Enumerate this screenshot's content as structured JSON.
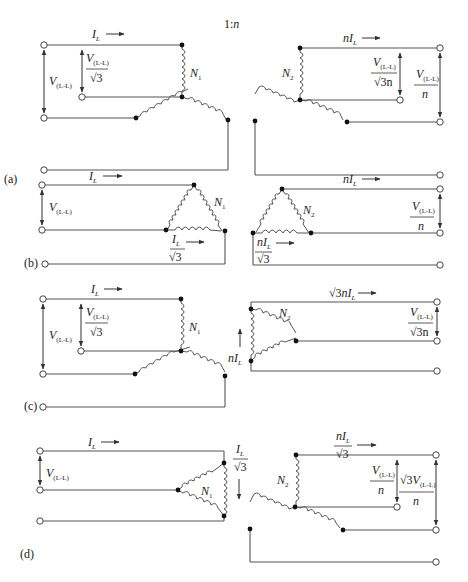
{
  "figure": {
    "ratio_label": "1:n",
    "panels": [
      {
        "id": "a",
        "tag": "(a)",
        "primary": {
          "connection": "wye",
          "current_label": "I_L",
          "line_voltage": "V(L-L)",
          "phase_voltage": "V(L-L)/√3",
          "winding": "N1"
        },
        "secondary": {
          "connection": "wye",
          "current_label": "nI_L",
          "phase_voltage": "V(L-L)/(√3n)",
          "line_voltage": "V(L-L)/n",
          "winding": "N2"
        }
      },
      {
        "id": "b",
        "tag": "(b)",
        "primary": {
          "connection": "delta",
          "current_label": "I_L",
          "line_voltage": "V(L-L)",
          "phase_current": "I_L/√3",
          "winding": "N1"
        },
        "secondary": {
          "connection": "delta",
          "current_label": "nI_L",
          "phase_current": "nI_L/√3",
          "line_voltage": "V(L-L)/n",
          "winding": "N2"
        }
      },
      {
        "id": "c",
        "tag": "(c)",
        "primary": {
          "connection": "wye",
          "current_label": "I_L",
          "line_voltage": "V(L-L)",
          "phase_voltage": "V(L-L)/√3",
          "winding": "N1"
        },
        "secondary": {
          "connection": "delta",
          "current_label": "√3nI_L",
          "phase_current": "nI_L",
          "line_voltage": "V(L-L)/(√3n)",
          "winding": "N2"
        }
      },
      {
        "id": "d",
        "tag": "(d)",
        "primary": {
          "connection": "delta",
          "current_label": "I_L",
          "line_voltage": "V(L-L)",
          "phase_current": "I_L/√3",
          "winding": "N1"
        },
        "secondary": {
          "connection": "wye",
          "current_label": "nI_L/√3",
          "phase_voltage": "V(L-L)/n",
          "line_voltage": "√3V(L-L)/n",
          "winding": "N2"
        }
      }
    ]
  },
  "text": {
    "ratio": "1:",
    "ratio_n": "n",
    "I": "I",
    "L": "L",
    "n": "n",
    "V": "V",
    "LL": "(L-L)",
    "sqrt3": "√3",
    "sqrt3n": "√3n",
    "N": "N",
    "one": "1",
    "two": "2",
    "tag_a": "(a)",
    "tag_b": "(b)",
    "tag_c": "(c)",
    "tag_d": "(d)"
  }
}
